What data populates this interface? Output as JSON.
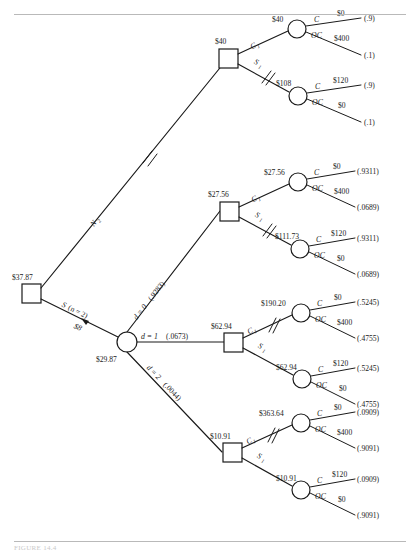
{
  "figure": {
    "caption": "FIGURE 14.4",
    "root_node": {
      "name": "root-decision-node",
      "value": "$37.87",
      "shape": "square"
    },
    "root_branches": [
      {
        "id": "branch-n2",
        "label": "N",
        "label_sub": "2",
        "has_double_slash": true
      },
      {
        "id": "branch-survey",
        "label": "S",
        "label_suffix": " (n = 2)",
        "cost": "$8",
        "has_arrow": true
      }
    ],
    "chance_node": {
      "name": "survey-result-chance-node",
      "value": "$29.87",
      "shape": "circle"
    },
    "chance_branches": [
      {
        "id": "d0",
        "label": "d = 0",
        "prob": "(.9283)"
      },
      {
        "id": "d1",
        "label": "d = 1",
        "prob": "(.0673)"
      },
      {
        "id": "d2",
        "label": "d = 2",
        "prob": "(.0044)"
      }
    ],
    "subtrees": [
      {
        "id": "subtree-n2",
        "decision_value": "$40",
        "top_edge": {
          "label": "C",
          "label_sub": "1",
          "slash": false,
          "node_value": "$40",
          "outcomes": [
            {
              "label": "C",
              "payoff": "$0",
              "prob": "(.9)"
            },
            {
              "label": "OC",
              "payoff": "$400",
              "prob": "(.1)"
            }
          ]
        },
        "bottom_edge": {
          "label": "S",
          "label_sub": "1",
          "slash": true,
          "node_value": "$108",
          "outcomes": [
            {
              "label": "C",
              "payoff": "$120",
              "prob": "(.9)"
            },
            {
              "label": "OC",
              "payoff": "$0",
              "prob": "(.1)"
            }
          ]
        }
      },
      {
        "id": "subtree-d0",
        "decision_value": "$27.56",
        "top_edge": {
          "label": "C",
          "label_sub": "1",
          "slash": false,
          "node_value": "$27.56",
          "outcomes": [
            {
              "label": "C",
              "payoff": "$0",
              "prob": "(.9311)"
            },
            {
              "label": "OC",
              "payoff": "$400",
              "prob": "(.0689)"
            }
          ]
        },
        "bottom_edge": {
          "label": "S",
          "label_sub": "1",
          "slash": true,
          "node_value": "$111.73",
          "outcomes": [
            {
              "label": "C",
              "payoff": "$120",
              "prob": "(.9311)"
            },
            {
              "label": "OC",
              "payoff": "$0",
              "prob": "(.0689)"
            }
          ]
        }
      },
      {
        "id": "subtree-d1",
        "decision_value": "$62.94",
        "top_edge": {
          "label": "C",
          "label_sub": "1",
          "slash": true,
          "node_value": "$190.20",
          "outcomes": [
            {
              "label": "C",
              "payoff": "$0",
              "prob": "(.5245)"
            },
            {
              "label": "OC",
              "payoff": "$400",
              "prob": "(.4755)"
            }
          ]
        },
        "bottom_edge": {
          "label": "S",
          "label_sub": "1",
          "slash": false,
          "node_value": "$62.94",
          "outcomes": [
            {
              "label": "C",
              "payoff": "$120",
              "prob": "(.5245)"
            },
            {
              "label": "OC",
              "payoff": "$0",
              "prob": "(.4755)"
            }
          ]
        }
      },
      {
        "id": "subtree-d2",
        "decision_value": "$10.91",
        "top_edge": {
          "label": "C",
          "label_sub": "1",
          "slash": true,
          "node_value": "$363.64",
          "outcomes": [
            {
              "label": "C",
              "payoff": "$0",
              "prob": "(.0909)"
            },
            {
              "label": "OC",
              "payoff": "$400",
              "prob": "(.9091)"
            }
          ]
        },
        "bottom_edge": {
          "label": "S",
          "label_sub": "1",
          "slash": false,
          "node_value": "$10.91",
          "outcomes": [
            {
              "label": "C",
              "payoff": "$120",
              "prob": "(.0909)"
            },
            {
              "label": "OC",
              "payoff": "$0",
              "prob": "(.9091)"
            }
          ]
        }
      }
    ]
  }
}
